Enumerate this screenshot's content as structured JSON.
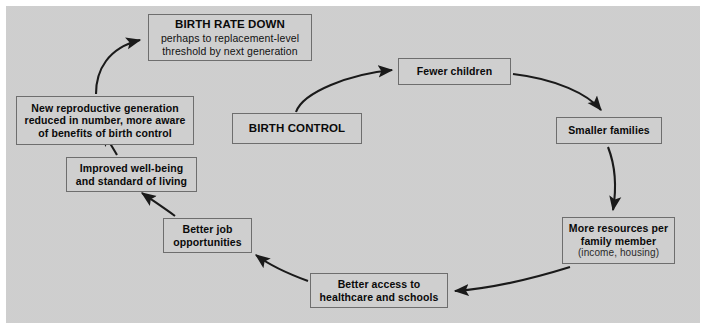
{
  "diagram": {
    "panel_color": "#d2d2d2",
    "node_fill": "#cfcfcf",
    "node_border": "#6e6e6e",
    "arrow_color": "#1a1a1a",
    "nodes": {
      "birth_rate_down": {
        "title": "BIRTH RATE DOWN",
        "sub_line1": "perhaps to replacement-level",
        "sub_line2": "threshold by next generation"
      },
      "new_generation": {
        "line1": "New reproductive generation",
        "line2": "reduced in number, more aware",
        "line3": "of benefits of birth control"
      },
      "improved": {
        "line1": "Improved well-being",
        "line2": "and standard of living"
      },
      "jobs": {
        "line1": "Better job",
        "line2": "opportunities"
      },
      "healthcare": {
        "line1": "Better access to",
        "line2": "healthcare and schools"
      },
      "resources": {
        "line1": "More resources per",
        "line2": "family member",
        "sub": "(income, housing)"
      },
      "smaller_families": {
        "line1": "Smaller families"
      },
      "fewer_children": {
        "line1": "Fewer children"
      },
      "birth_control": {
        "line1": "BIRTH CONTROL"
      }
    },
    "arrows": [
      {
        "name": "birth-control-to-fewer-children",
        "from": "birth_control",
        "to": "fewer_children"
      },
      {
        "name": "fewer-children-to-smaller-families",
        "from": "fewer_children",
        "to": "smaller_families"
      },
      {
        "name": "smaller-families-to-resources",
        "from": "smaller_families",
        "to": "resources"
      },
      {
        "name": "resources-to-healthcare",
        "from": "resources",
        "to": "healthcare"
      },
      {
        "name": "healthcare-to-jobs",
        "from": "healthcare",
        "to": "jobs"
      },
      {
        "name": "jobs-to-improved",
        "from": "jobs",
        "to": "improved"
      },
      {
        "name": "improved-to-new-generation",
        "from": "improved",
        "to": "new_generation"
      },
      {
        "name": "new-generation-to-birth-rate-down",
        "from": "new_generation",
        "to": "birth_rate_down"
      }
    ]
  }
}
